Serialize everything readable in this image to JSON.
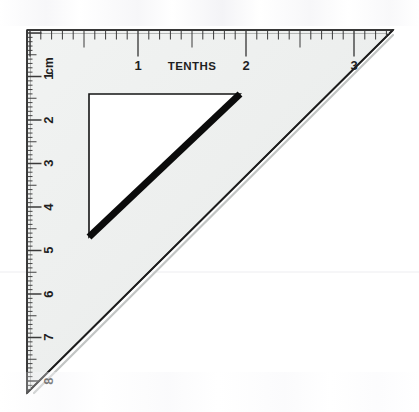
{
  "image": {
    "subject": "set-square",
    "description": "Scanned 45-degree drafting set square triangle with inch-tenths scale on top edge and centimetre scale on left edge",
    "width": 419,
    "height": 412,
    "background_color": "#ffffff"
  },
  "instrument": {
    "body_fill": "#eef0ef",
    "body_fill_alt": "#e9ebea",
    "outline_color": "#2a2a2a",
    "hypotenuse_shadow_color": "#b9bcbb",
    "vertices": {
      "right_angle": [
        27,
        30
      ],
      "top_right": [
        393,
        30
      ],
      "bottom_left": [
        27,
        393
      ]
    }
  },
  "cutout": {
    "fill": "#ffffff",
    "stroke_color": "#111111",
    "hypotenuse_stroke_color": "#0a0a0a",
    "vertices": {
      "top_left": [
        89,
        94
      ],
      "top_right": [
        240,
        94
      ],
      "bottom_left": [
        89,
        237
      ]
    }
  },
  "top_scale": {
    "name": "tenths-scale",
    "unit_label": "TENTHS",
    "label_color": "#1f1f1f",
    "origin_x": 30,
    "pixels_per_unit": 108,
    "numbers": [
      {
        "value": "1",
        "x": 138
      },
      {
        "value": "2",
        "x": 246
      },
      {
        "value": "3",
        "x": 354
      }
    ],
    "ticks_per_unit": 10,
    "tick_color": "#3a3a3a"
  },
  "left_scale": {
    "name": "centimetre-scale",
    "unit_label": "cm",
    "label_color": "#1f1f1f",
    "origin_y": 33,
    "pixels_per_unit": 43.5,
    "numbers": [
      {
        "value": "1",
        "y": 76
      },
      {
        "value": "2",
        "y": 120
      },
      {
        "value": "3",
        "y": 163
      },
      {
        "value": "4",
        "y": 207
      },
      {
        "value": "5",
        "y": 250
      },
      {
        "value": "6",
        "y": 294
      },
      {
        "value": "7",
        "y": 337
      },
      {
        "value": "8",
        "y": 381
      }
    ],
    "ticks_per_unit": 10,
    "tick_color": "#3a3a3a"
  },
  "artifacts": {
    "scan_line": {
      "name": "horizontal-scan-line",
      "y": 272,
      "color": "#ededf0"
    }
  }
}
